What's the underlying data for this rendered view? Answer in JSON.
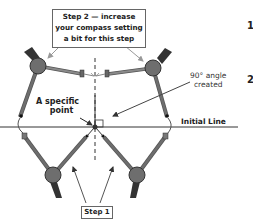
{
  "diagram": {
    "labels": {
      "step2_line1": "Step 2 — increase",
      "step2_line2": "your compass setting",
      "step2_line3": "a bit for this step",
      "step1": "Step 1",
      "specific_point_line1": "A specific",
      "specific_point_line2": "point",
      "angle_line1": "90° angle",
      "angle_line2": "created",
      "initial_line": "Initial Line"
    },
    "edge_glyphs": [
      "1",
      "2"
    ],
    "colors": {
      "compass_body": "#6e6e6e",
      "compass_outline": "#333333",
      "line": "#222222",
      "arrow": "#888888",
      "background": "#ffffff"
    }
  }
}
